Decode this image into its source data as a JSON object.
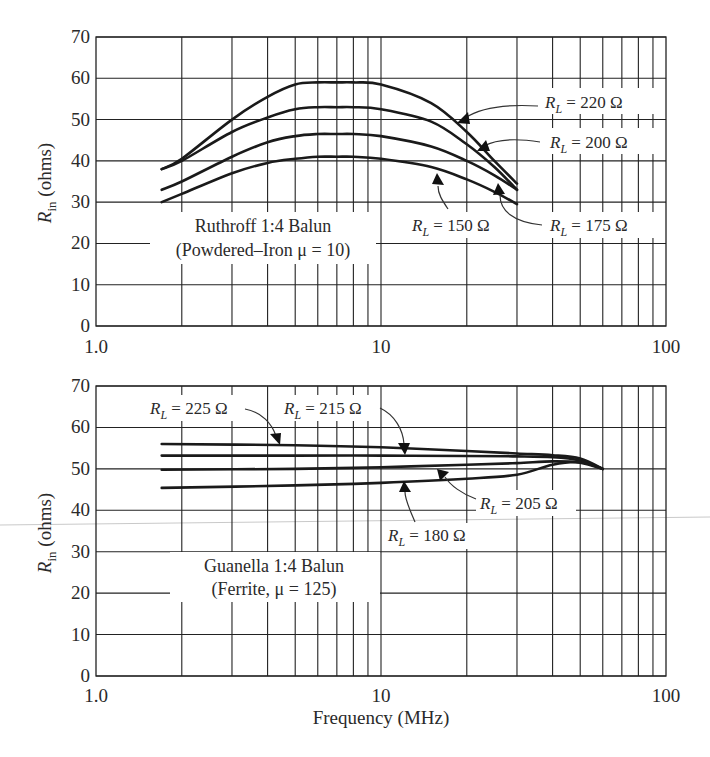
{
  "chart_data": [
    {
      "type": "line",
      "title": "Ruthroff 1:4 Balun",
      "subtitle": "(Powdered–Iron μ = 10)",
      "xlabel": "",
      "ylabel": "R_in (ohms)",
      "xscale": "log",
      "xlim": [
        1.0,
        100
      ],
      "ylim": [
        0,
        70
      ],
      "x_tick_labels": [
        "1.0",
        "10",
        "100"
      ],
      "y_ticks": [
        0,
        10,
        20,
        30,
        40,
        50,
        60,
        70
      ],
      "grid": true,
      "x": [
        1.7,
        2,
        3,
        4,
        5,
        6,
        7,
        8,
        10,
        15,
        20,
        25,
        30
      ],
      "series": [
        {
          "name": "R_L = 220 Ω",
          "values": [
            38,
            40.5,
            50,
            55.5,
            58.5,
            59,
            59,
            59,
            58.5,
            54,
            47,
            40,
            34.5
          ]
        },
        {
          "name": "R_L = 200 Ω",
          "values": [
            38,
            40,
            47,
            50.5,
            52.5,
            53,
            53,
            53,
            52.5,
            49.5,
            44,
            38.5,
            33
          ]
        },
        {
          "name": "R_L = 175 Ω",
          "values": [
            33,
            35,
            41,
            44.5,
            46,
            46.5,
            46.5,
            46.5,
            46,
            43.5,
            40,
            36.5,
            33
          ]
        },
        {
          "name": "R_L = 150 Ω",
          "values": [
            30,
            32,
            37,
            39.5,
            40.5,
            41,
            41,
            41,
            40.5,
            38.5,
            35.5,
            32.5,
            29.5
          ]
        }
      ]
    },
    {
      "type": "line",
      "title": "Guanella 1:4 Balun",
      "subtitle": "(Ferrite, μ = 125)",
      "xlabel": "Frequency (MHz)",
      "ylabel": "R_in (ohms)",
      "xscale": "log",
      "xlim": [
        1.0,
        100
      ],
      "ylim": [
        0,
        70
      ],
      "x_tick_labels": [
        "1.0",
        "10",
        "100"
      ],
      "y_ticks": [
        0,
        10,
        20,
        30,
        40,
        50,
        60,
        70
      ],
      "grid": true,
      "x": [
        1.7,
        5,
        10,
        20,
        30,
        40,
        50,
        60
      ],
      "series": [
        {
          "name": "R_L = 225 Ω",
          "values": [
            56,
            55.7,
            55.2,
            54.3,
            53.7,
            53.3,
            52.5,
            50
          ]
        },
        {
          "name": "R_L = 215 Ω",
          "values": [
            53.2,
            53.2,
            53.2,
            53.1,
            53,
            52.8,
            52,
            50
          ]
        },
        {
          "name": "R_L = 205 Ω",
          "values": [
            49.8,
            50,
            50.4,
            51,
            51.4,
            51.8,
            51.5,
            50
          ]
        },
        {
          "name": "R_L = 180 Ω",
          "values": [
            45.4,
            46,
            46.6,
            47.6,
            48.6,
            51,
            51.6,
            50
          ]
        }
      ]
    }
  ],
  "axes": {
    "y_tick_labels": [
      "0",
      "10",
      "20",
      "30",
      "40",
      "50",
      "60",
      "70"
    ],
    "x_tick_labels": [
      "1.0",
      "10",
      "100"
    ],
    "ylabel_main": "R",
    "ylabel_sub": "in",
    "ylabel_unit": " (ohms)",
    "xlabel": "Frequency (MHz)"
  },
  "top_panel": {
    "title_line1": "Ruthroff 1:4 Balun",
    "title_line2": "(Powdered–Iron μ = 10)",
    "labels": [
      {
        "sym": "R",
        "sub": "L",
        "value": " = 220 Ω"
      },
      {
        "sym": "R",
        "sub": "L",
        "value": " = 200 Ω"
      },
      {
        "sym": "R",
        "sub": "L",
        "value": " = 150 Ω"
      },
      {
        "sym": "R",
        "sub": "L",
        "value": " = 175 Ω"
      }
    ]
  },
  "bottom_panel": {
    "title_line1": "Guanella 1:4 Balun",
    "title_line2": "(Ferrite, μ = 125)",
    "labels": [
      {
        "sym": "R",
        "sub": "L",
        "value": " = 225 Ω"
      },
      {
        "sym": "R",
        "sub": "L",
        "value": " = 215 Ω"
      },
      {
        "sym": "R",
        "sub": "L",
        "value": " = 205 Ω"
      },
      {
        "sym": "R",
        "sub": "L",
        "value": " = 180 Ω"
      }
    ]
  }
}
